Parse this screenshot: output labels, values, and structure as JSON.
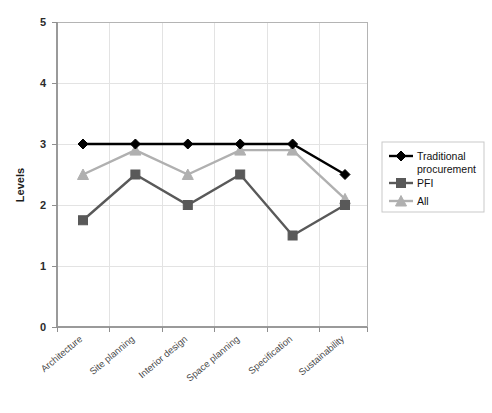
{
  "chart_data": {
    "type": "line",
    "title": "",
    "xlabel": "",
    "ylabel": "Levels",
    "ylim": [
      0,
      5
    ],
    "yticks": [
      "0",
      "1",
      "2",
      "3",
      "4",
      "5"
    ],
    "grid": "horizontal-and-vertical",
    "legend_position": "right",
    "categories": [
      "Architecture",
      "Site planning",
      "Interior design",
      "Space planning",
      "Specification",
      "Sustainability"
    ],
    "series": [
      {
        "name": "Traditional procurement",
        "color": "#000000",
        "marker": "diamond",
        "values": [
          3,
          3,
          3,
          3,
          3,
          2.5
        ]
      },
      {
        "name": "PFI",
        "color": "#595959",
        "marker": "square",
        "values": [
          1.75,
          2.5,
          2,
          2.5,
          1.5,
          2
        ]
      },
      {
        "name": "All",
        "color": "#b0b0b0",
        "marker": "triangle",
        "values": [
          2.5,
          2.9,
          2.5,
          2.9,
          2.9,
          2.1
        ]
      }
    ]
  },
  "legend": {
    "entries": [
      {
        "label": "Traditional procurement",
        "color": "#000000",
        "marker": "diamond"
      },
      {
        "label": "PFI",
        "color": "#595959",
        "marker": "square"
      },
      {
        "label": "All",
        "color": "#b0b0b0",
        "marker": "triangle"
      }
    ]
  },
  "axes": {
    "y_title": "Levels",
    "y_tick_labels": [
      "5",
      "4",
      "3",
      "2",
      "1",
      "0"
    ],
    "x_tick_labels": [
      "Architecture",
      "Site planning",
      "Interior design",
      "Space planning",
      "Specification",
      "Sustainability"
    ]
  }
}
